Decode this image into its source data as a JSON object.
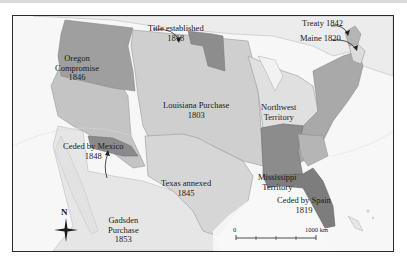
{
  "map": {
    "title": "",
    "colors": {
      "ocean": "#f7f7f7",
      "land_foreign": "#e8e8e8",
      "louisiana": "#cfcfcf",
      "ceded_mexico": "#c4c4c4",
      "texas": "#d6d6d6",
      "oregon": "#9f9f9f",
      "original_states": "#a9a9a9",
      "northwest": "#e0e0e0",
      "mississippi": "#8c8c8c",
      "spain": "#7d7d7d",
      "gadsden": "#8a8a8a",
      "title_1818": "#8d8d8d",
      "treaty_1842": "#b5b5b5",
      "maine": "#dcdcdc",
      "border": "#9a9a9a",
      "frame": "#2a2a2a"
    },
    "regions": [
      {
        "name": "Oregon Compromise",
        "year": "1846",
        "lines": [
          "Oregon",
          "Compromise",
          "1846"
        ]
      },
      {
        "name": "Title established",
        "year": "1818",
        "lines": [
          "Title established",
          "1818"
        ]
      },
      {
        "name": "Louisiana Purchase",
        "year": "1803",
        "lines": [
          "Louisiana Purchase",
          "1803"
        ]
      },
      {
        "name": "Northwest Territory",
        "year": "",
        "lines": [
          "Northwest",
          "Territory"
        ]
      },
      {
        "name": "Ceded by Mexico",
        "year": "1848",
        "lines": [
          "Ceded by Mexico",
          "1848"
        ]
      },
      {
        "name": "Texas annexed",
        "year": "1845",
        "lines": [
          "Texas annexed",
          "1845"
        ]
      },
      {
        "name": "Mississippi Territory",
        "year": "",
        "lines": [
          "Mississippi",
          "Territory"
        ]
      },
      {
        "name": "Ceded by Spain",
        "year": "1819",
        "lines": [
          "Ceded by Spain",
          "1819"
        ]
      },
      {
        "name": "Gadsden Purchase",
        "year": "1853",
        "lines": [
          "Gadsden",
          "Purchase",
          "1853"
        ]
      },
      {
        "name": "Treaty 1842",
        "year": "1842",
        "lines": [
          "Treaty 1842"
        ]
      },
      {
        "name": "Maine 1820",
        "year": "1820",
        "lines": [
          "Maine 1820"
        ]
      }
    ],
    "compass": {
      "label": "N"
    },
    "scale": {
      "start": "0",
      "end": "1000 km"
    }
  }
}
